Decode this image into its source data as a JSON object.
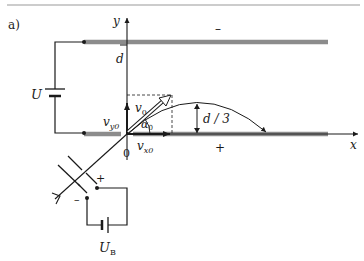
{
  "figure": {
    "panel_label": "a)",
    "axes": {
      "x_label": "x",
      "y_label": "y",
      "origin_label": "0"
    },
    "plates": {
      "top_sign": "–",
      "bottom_sign": "+",
      "plate_color": "#8c8c8c",
      "separation_label": "d"
    },
    "circuit": {
      "plate_voltage_label": "U",
      "accelerating_voltage_label": "U",
      "accelerating_voltage_subscript": "B",
      "gun_plus": "+",
      "gun_minus": "–"
    },
    "vectors": {
      "v0_base": "v",
      "v0_sub": "0",
      "vy0_base": "v",
      "vy0_sub": "y0",
      "vx0_base": "v",
      "vx0_sub": "x0",
      "angle_base": "α",
      "angle_sub": "0"
    },
    "trajectory": {
      "peak_height_label": "d / 3"
    },
    "colors": {
      "ink": "#1a1a1a",
      "rule": "#9a9a9a"
    }
  }
}
